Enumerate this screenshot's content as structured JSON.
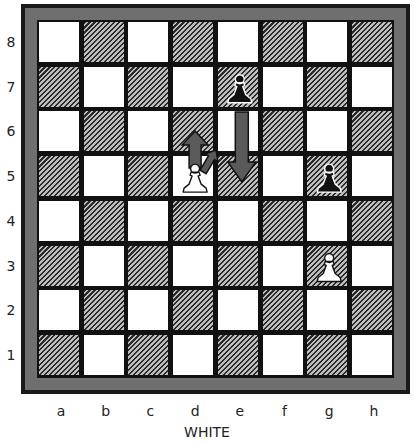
{
  "board": {
    "side_label": "WHITE",
    "files": [
      "a",
      "b",
      "c",
      "d",
      "e",
      "f",
      "g",
      "h"
    ],
    "ranks": [
      "8",
      "7",
      "6",
      "5",
      "4",
      "3",
      "2",
      "1"
    ],
    "colors": {
      "frame": "#1a1a1a",
      "frame_inner": "#6f6f6f",
      "light": "#ffffff",
      "dark_hatch": "#2a2a2a"
    }
  },
  "pieces": [
    {
      "square": "e7",
      "type": "pawn",
      "color": "black"
    },
    {
      "square": "g5",
      "type": "pawn",
      "color": "black"
    },
    {
      "square": "d5",
      "type": "pawn",
      "color": "white"
    },
    {
      "square": "g3",
      "type": "pawn",
      "color": "white"
    }
  ],
  "arrows": [
    {
      "from": "e7",
      "to": "e5",
      "label": "black pawn double step"
    },
    {
      "from": "d5",
      "to": "d6",
      "label": "white pawn advance"
    },
    {
      "from": "d5",
      "to": "e6",
      "label": "white pawn en passant capture"
    }
  ]
}
